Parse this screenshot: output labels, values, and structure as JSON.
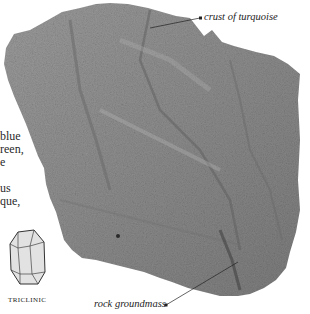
{
  "specimen": {
    "name": "turquoise on rock",
    "colors": {
      "rock_base": "#8e8e8e",
      "rock_light": "#b4b4b4",
      "rock_dark": "#5e5e5e",
      "background": "#ffffff",
      "text": "#2a2a2a"
    }
  },
  "body_text": {
    "lines": [
      "blue",
      "reen,",
      "e",
      "",
      "us",
      "que,"
    ]
  },
  "labels": {
    "top": "crust of turquoise",
    "bottom": "rock groundmass"
  },
  "crystal_system": {
    "icon": "triclinic-crystal-icon",
    "caption": "TRICLINIC"
  }
}
